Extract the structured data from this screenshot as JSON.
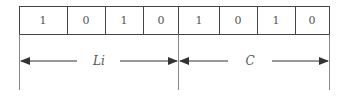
{
  "diagram": {
    "bits": [
      "1",
      "0",
      "1",
      "0",
      "1",
      "0",
      "1",
      "0"
    ],
    "fields": [
      {
        "label": "Li",
        "start_bit": 0,
        "end_bit": 3
      },
      {
        "label": "C",
        "start_bit": 4,
        "end_bit": 7
      }
    ],
    "colors": {
      "line": "#444444",
      "text": "#555555",
      "background": "#ffffff"
    }
  }
}
